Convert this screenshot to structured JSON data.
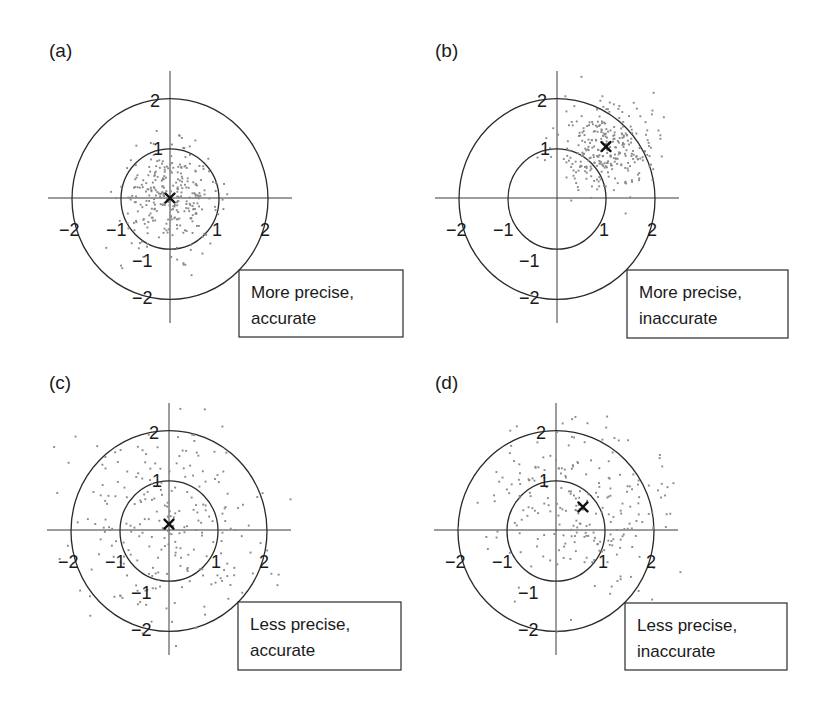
{
  "figure": {
    "panels": [
      {
        "id": "a",
        "label": "(a)",
        "caption_line1": "More precise,",
        "caption_line2": "accurate",
        "center_px": [
          170,
          198
        ],
        "box_px": [
          239,
          270,
          164,
          67
        ]
      },
      {
        "id": "b",
        "label": "(b)",
        "caption_line1": "More precise,",
        "caption_line2": "inaccurate",
        "center_px": [
          557,
          198
        ],
        "box_px": [
          627,
          270,
          161,
          68
        ]
      },
      {
        "id": "c",
        "label": "(c)",
        "caption_line1": "Less precise,",
        "caption_line2": "accurate",
        "center_px": [
          169,
          530
        ],
        "box_px": [
          238,
          602,
          163,
          68
        ]
      },
      {
        "id": "d",
        "label": "(d)",
        "caption_line1": "Less precise,",
        "caption_line2": "inaccurate",
        "center_px": [
          556,
          530
        ],
        "box_px": [
          625,
          603,
          162,
          67
        ]
      }
    ],
    "tick_labels": {
      "neg2": "−2",
      "neg1": "−1",
      "pos1": "1",
      "pos2": "2"
    },
    "unit_px": 49,
    "colors": {
      "points": "#8a8a8a",
      "lines": "#2a2a2a",
      "marker": "#111111"
    }
  },
  "chart_data": [
    {
      "type": "scatter",
      "title": "(a) More precise, accurate",
      "xlabel": "",
      "ylabel": "",
      "xlim": [
        -2.5,
        2.5
      ],
      "ylim": [
        -2.5,
        2.5
      ],
      "reference_circles": [
        1,
        2
      ],
      "axis_ticks": [
        -2,
        -1,
        1,
        2
      ],
      "grid": false,
      "series": [
        {
          "name": "estimates",
          "mean": [
            0.0,
            0.0
          ],
          "std": [
            0.5,
            0.5
          ],
          "n": 300
        }
      ],
      "mean_marker": {
        "x": 0.0,
        "y": 0.0,
        "symbol": "x"
      }
    },
    {
      "type": "scatter",
      "title": "(b) More precise, inaccurate",
      "xlabel": "",
      "ylabel": "",
      "xlim": [
        -2.5,
        2.5
      ],
      "ylim": [
        -2.5,
        2.5
      ],
      "reference_circles": [
        1,
        2
      ],
      "axis_ticks": [
        -2,
        -1,
        1,
        2
      ],
      "grid": false,
      "series": [
        {
          "name": "estimates",
          "mean": [
            1.0,
            1.05
          ],
          "std": [
            0.48,
            0.45
          ],
          "n": 300
        }
      ],
      "mean_marker": {
        "x": 1.0,
        "y": 1.05,
        "symbol": "x"
      }
    },
    {
      "type": "scatter",
      "title": "(c) Less precise, accurate",
      "xlabel": "",
      "ylabel": "",
      "xlim": [
        -2.5,
        2.5
      ],
      "ylim": [
        -2.5,
        2.5
      ],
      "reference_circles": [
        1,
        2
      ],
      "axis_ticks": [
        -2,
        -1,
        1,
        2
      ],
      "grid": false,
      "series": [
        {
          "name": "estimates",
          "mean": [
            0.0,
            0.12
          ],
          "std": [
            1.05,
            1.05
          ],
          "n": 250
        }
      ],
      "mean_marker": {
        "x": 0.0,
        "y": 0.12,
        "symbol": "x"
      }
    },
    {
      "type": "scatter",
      "title": "(d) Less precise, inaccurate",
      "xlabel": "",
      "ylabel": "",
      "xlim": [
        -2.5,
        2.5
      ],
      "ylim": [
        -2.5,
        2.5
      ],
      "reference_circles": [
        1,
        2
      ],
      "axis_ticks": [
        -2,
        -1,
        1,
        2
      ],
      "grid": false,
      "series": [
        {
          "name": "estimates",
          "mean": [
            0.55,
            0.47
          ],
          "std": [
            0.95,
            0.95
          ],
          "n": 250
        }
      ],
      "mean_marker": {
        "x": 0.55,
        "y": 0.47,
        "symbol": "x"
      }
    }
  ]
}
